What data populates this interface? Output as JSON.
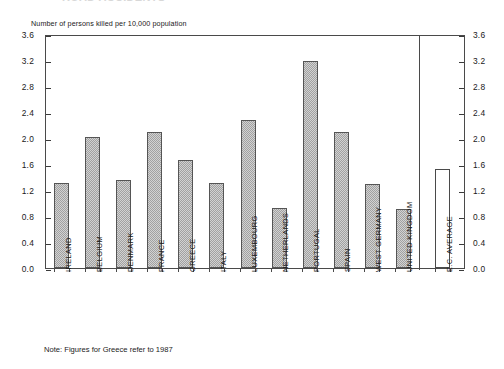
{
  "title_ghost": "ROAD ACCIDENTS",
  "axis_caption": "Number of persons killed per 10,000 population",
  "note": "Note: Figures for Greece refer to 1987",
  "y_ticks": [
    "0.0",
    "0.4",
    "0.8",
    "1.2",
    "1.6",
    "2.0",
    "2.4",
    "2.8",
    "3.2",
    "3.6"
  ],
  "chart_data": {
    "type": "bar",
    "title": "",
    "subtitle": "",
    "xlabel": "",
    "ylabel": "Number of persons killed per 10,000 population",
    "ylim": [
      0.0,
      3.6
    ],
    "ytick_step": 0.4,
    "yticks": [
      0.0,
      0.4,
      0.8,
      1.2,
      1.6,
      2.0,
      2.4,
      2.8,
      3.2,
      3.6
    ],
    "grid": false,
    "legend": false,
    "axis_on_both_sides": true,
    "annotations": [
      "Note: Figures for Greece refer to 1987"
    ],
    "categories": [
      "IRELAND",
      "BELGIUM",
      "DENMARK",
      "FRANCE",
      "GREECE",
      "ITALY",
      "LUXEMBOURG",
      "NETHERLANDS",
      "PORTUGAL",
      "SPAIN",
      "WEST GERMANY",
      "UNITED KINGDOM",
      "E.C. AVERAGE"
    ],
    "values": [
      1.31,
      2.01,
      1.36,
      2.1,
      1.66,
      1.31,
      2.27,
      0.93,
      3.18,
      2.1,
      1.29,
      0.91,
      1.52
    ],
    "bar_styles": [
      "hatched",
      "hatched",
      "hatched",
      "hatched",
      "hatched",
      "hatched",
      "hatched",
      "hatched",
      "hatched",
      "hatched",
      "hatched",
      "hatched",
      "hollow"
    ],
    "separator_after_category": "UNITED KINGDOM"
  },
  "colors": {
    "bar_fill": "#d2d2d2",
    "bar_hatch": "#787878",
    "bar_border": "#555555",
    "axis": "#4a4a4a",
    "text": "#1a1a1a",
    "background": "#ffffff"
  }
}
